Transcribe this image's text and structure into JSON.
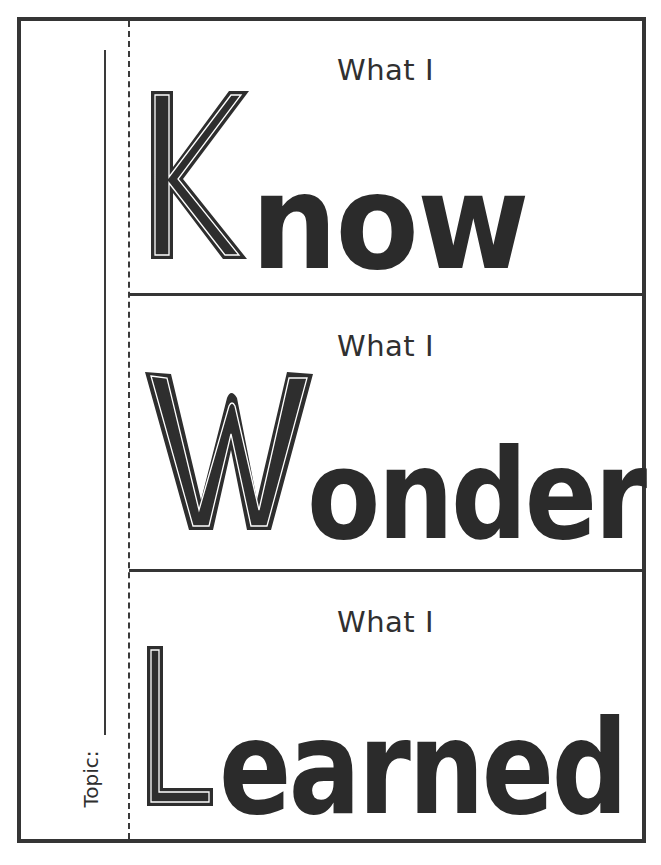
{
  "worksheet": {
    "topic_label": "Topic:",
    "colors": {
      "ink": "#2e2e2e",
      "paper": "#ffffff",
      "border": "#353535"
    },
    "panels": [
      {
        "prefix": "What I",
        "capital": "K",
        "rest": "now",
        "word": "Know"
      },
      {
        "prefix": "What I",
        "capital": "W",
        "rest": "onder",
        "word": "Wonder"
      },
      {
        "prefix": "What I",
        "capital": "L",
        "rest": "earned",
        "word": "Learned"
      }
    ]
  }
}
